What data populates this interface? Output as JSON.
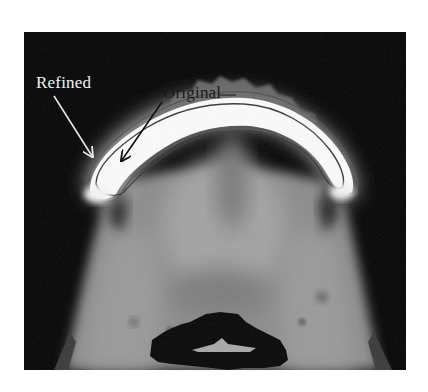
{
  "figure": {
    "type": "axial CT slice with segmentation contours",
    "annotations": [
      {
        "label": "Refined",
        "text_color": "#f2f2f2",
        "arrow_color": "#e6e6e6"
      },
      {
        "label": "Original",
        "text_color": "#1a1a1a",
        "arrow_color": "#111111"
      }
    ],
    "colors": {
      "background": "#ffffff",
      "scan_background": "#050505",
      "bone": "#fbfbfb",
      "soft_tissue": "#8e8e8e",
      "air_cavity": "#060606",
      "contour_original": "#3a3a3a",
      "contour_refined": "#555555"
    }
  }
}
